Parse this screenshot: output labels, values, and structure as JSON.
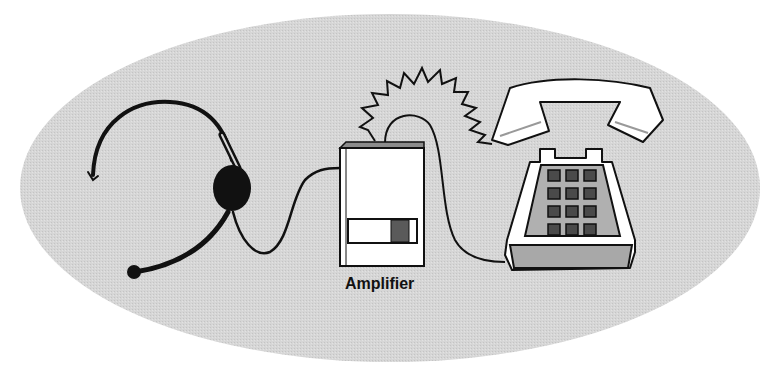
{
  "diagram": {
    "type": "illustration",
    "components": [
      {
        "id": "headset",
        "name": "Headset",
        "icon": "headset-icon"
      },
      {
        "id": "amplifier",
        "name": "Amplifier",
        "icon": "amplifier-box-icon",
        "label": "Amplifier"
      },
      {
        "id": "telephone",
        "name": "Telephone",
        "icon": "desk-phone-icon"
      },
      {
        "id": "handset",
        "name": "Handset",
        "icon": "phone-handset-icon"
      },
      {
        "id": "ring",
        "name": "Ringing signal",
        "icon": "zigzag-ring-icon"
      }
    ],
    "connections": [
      {
        "from": "headset",
        "to": "amplifier",
        "style": "cord"
      },
      {
        "from": "amplifier",
        "to": "telephone",
        "style": "cord"
      },
      {
        "from": "amplifier",
        "to": "handset",
        "style": "zigzag-ring"
      }
    ],
    "keypad": {
      "rows": 4,
      "cols": 3
    }
  },
  "labels": {
    "amplifier": "Amplifier"
  },
  "colors": {
    "background": "#ffffff",
    "ellipse": "#d6d6d6",
    "outline": "#111111",
    "device_fill": "#ffffff",
    "keypad_panel": "#b0b0b0",
    "key": "#4a4a4a",
    "phone_base_front": "#a8a8a8",
    "amp_top": "#8c8c8c"
  }
}
